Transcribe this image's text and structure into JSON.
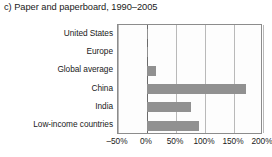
{
  "chart_data": {
    "type": "bar",
    "orientation": "horizontal",
    "title": "c) Paper and paperboard, 1990–2005",
    "xlabel": "",
    "ylabel": "",
    "categories": [
      "United States",
      "Europe",
      "Global average",
      "China",
      "India",
      "Low-income countries"
    ],
    "values": [
      2,
      1,
      15,
      170,
      75,
      90
    ],
    "value_suffix": "%",
    "xlim": [
      -50,
      200
    ],
    "xticks": [
      -50,
      0,
      50,
      100,
      150,
      200
    ],
    "xtick_labels": [
      "–50%",
      "0%",
      "50%",
      "100%",
      "150%",
      "200%"
    ],
    "grid": true,
    "grid_axis": "x",
    "legend": false,
    "bar_color": "#919191",
    "grid_color": "#b9b9b9",
    "zero_line_color": "#6b6b6b",
    "frame_color": "#8c8c8c",
    "text_color": "#1a1a1a"
  }
}
